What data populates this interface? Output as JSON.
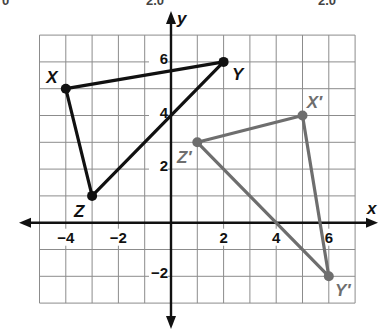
{
  "top_fragments": [
    {
      "text": "0",
      "x": 2
    },
    {
      "text": "2.0",
      "x": 146
    },
    {
      "text": "2.0",
      "x": 318
    }
  ],
  "axes": {
    "x_label": "x",
    "y_label": "y",
    "x_range": [
      -5,
      7
    ],
    "y_range": [
      -3,
      7
    ],
    "x_ticks": [
      {
        "value": -4,
        "label": "−4"
      },
      {
        "value": -2,
        "label": "−2"
      },
      {
        "value": 2,
        "label": "2"
      },
      {
        "value": 4,
        "label": "4"
      },
      {
        "value": 6,
        "label": "6"
      }
    ],
    "y_ticks": [
      {
        "value": 6,
        "label": "6"
      },
      {
        "value": 4,
        "label": "4"
      },
      {
        "value": 2,
        "label": "2"
      },
      {
        "value": -2,
        "label": "−2"
      }
    ],
    "grid": true
  },
  "figures": {
    "original": {
      "name": "Triangle XYZ",
      "color": "#111111",
      "vertices": [
        {
          "label": "X",
          "x": -4,
          "y": 5
        },
        {
          "label": "Y",
          "x": 2,
          "y": 6
        },
        {
          "label": "Z",
          "x": -3,
          "y": 1
        }
      ]
    },
    "image": {
      "name": "Triangle X'Y'Z'",
      "color": "#6e6e6e",
      "vertices": [
        {
          "label": "X′",
          "x": 5,
          "y": 4
        },
        {
          "label": "Y′",
          "x": 6,
          "y": -2
        },
        {
          "label": "Z′",
          "x": 1,
          "y": 3
        }
      ]
    }
  },
  "colors": {
    "grid": "#8c8c8c",
    "axis": "#111111",
    "original": "#111111",
    "image": "#6e6e6e"
  }
}
